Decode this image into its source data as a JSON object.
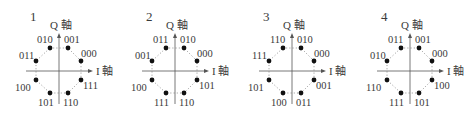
{
  "axes": {
    "q_label": "Q 軸",
    "i_label": "I 軸"
  },
  "diagrams": [
    {
      "number": "1",
      "left": 0,
      "labels": {
        "q_pos_left": "010",
        "q_pos_right": "001",
        "upper_left": "011",
        "upper_right": "000",
        "lower_left": "100",
        "lower_right": "111",
        "bottom_left": "101",
        "bottom_right": "110"
      }
    },
    {
      "number": "2",
      "left": 116,
      "labels": {
        "q_pos_left": "011",
        "q_pos_right": "010",
        "upper_left": "001",
        "upper_right": "000",
        "lower_left": "100",
        "lower_right": "101",
        "bottom_left": "111",
        "bottom_right": "110"
      }
    },
    {
      "number": "3",
      "left": 233,
      "labels": {
        "q_pos_left": "110",
        "q_pos_right": "010",
        "upper_left": "111",
        "upper_right": "000",
        "lower_left": "101",
        "lower_right": "001",
        "bottom_left": "100",
        "bottom_right": "011"
      }
    },
    {
      "number": "4",
      "left": 351,
      "labels": {
        "q_pos_left": "011",
        "q_pos_right": "001",
        "upper_left": "010",
        "upper_right": "000",
        "lower_left": "110",
        "lower_right": "100",
        "bottom_left": "111",
        "bottom_right": "101"
      }
    }
  ]
}
